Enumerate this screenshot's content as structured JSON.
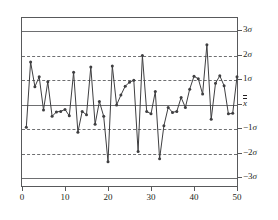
{
  "chart_data": {
    "type": "line",
    "title": "",
    "xlabel": "",
    "ylabel": "",
    "xlim": [
      0,
      50
    ],
    "ylim": [
      -3.4,
      3.4
    ],
    "grid": false,
    "legend": null,
    "x_ticks": [
      "0",
      "10",
      "20",
      "30",
      "40",
      "50"
    ],
    "x_tick_values": [
      0,
      10,
      20,
      30,
      40,
      50
    ],
    "y_tick_labels": [
      "3σ",
      "2σ",
      "1σ",
      "X̅̅",
      "−1σ",
      "−2σ",
      "−3σ"
    ],
    "y_tick_values": [
      3,
      2,
      1,
      0,
      -1,
      -2,
      -3
    ],
    "control_lines": [
      {
        "name": "ucl-3sigma",
        "value": 3,
        "style": "solid",
        "label": "3σ"
      },
      {
        "name": "warn-2sigma-upper",
        "value": 2,
        "style": "dashed",
        "label": "2σ"
      },
      {
        "name": "warn-1sigma-upper",
        "value": 1,
        "style": "dashed",
        "label": "1σ"
      },
      {
        "name": "center-line",
        "value": 0,
        "style": "solid",
        "label": "X̅̅"
      },
      {
        "name": "warn-1sigma-lower",
        "value": -1,
        "style": "dashed",
        "label": "−1σ"
      },
      {
        "name": "warn-2sigma-lower",
        "value": -2,
        "style": "dashed",
        "label": "−2σ"
      },
      {
        "name": "lcl-3sigma",
        "value": -3,
        "style": "solid",
        "label": "−3σ"
      }
    ],
    "series": [
      {
        "name": "sample-means",
        "marker": "filled-circle",
        "color": "#3f3f41",
        "x": [
          1,
          2,
          3,
          4,
          5,
          6,
          7,
          8,
          9,
          10,
          11,
          12,
          13,
          14,
          15,
          16,
          17,
          18,
          19,
          20,
          21,
          22,
          23,
          24,
          25,
          26,
          27,
          28,
          29,
          30,
          31,
          32,
          33,
          34,
          35,
          36,
          37,
          38,
          39,
          40,
          41,
          42,
          43,
          44,
          45,
          46,
          47,
          48,
          49,
          50
        ],
        "values": [
          -1.02,
          1.62,
          0.62,
          1.02,
          -0.32,
          0.82,
          -0.58,
          -0.4,
          -0.38,
          -0.3,
          -0.56,
          1.2,
          -1.22,
          -0.38,
          -0.52,
          1.42,
          -0.9,
          0.02,
          -0.58,
          -2.42,
          1.46,
          -0.12,
          0.28,
          0.64,
          0.8,
          0.88,
          -2.0,
          1.88,
          -0.38,
          -0.48,
          0.42,
          -2.3,
          -0.96,
          -0.22,
          -0.42,
          -0.38,
          0.18,
          -0.22,
          0.52,
          1.04,
          0.94,
          0.32,
          2.32,
          -0.7,
          0.76,
          1.06,
          0.66,
          -0.48,
          -0.46,
          1.02
        ]
      }
    ]
  },
  "colors": {
    "axis": "#58595b",
    "control_line": "#6e6f71",
    "series": "#3f3f41",
    "background": "#ffffff",
    "text": "#231f20"
  }
}
